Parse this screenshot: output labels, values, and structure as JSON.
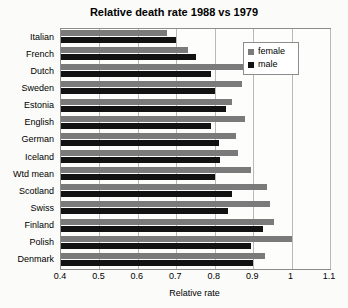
{
  "chart_data": {
    "type": "bar",
    "orientation": "horizontal",
    "title": "Relative death rate 1988 vs 1979",
    "xlabel": "Relative rate",
    "ylabel": "",
    "xlim": [
      0.4,
      1.1
    ],
    "xticks": [
      "0.4",
      "0.5",
      "0.6",
      "0.7",
      "0.8",
      "0.9",
      "1",
      "1.1"
    ],
    "xtick_values": [
      0.4,
      0.5,
      0.6,
      0.7,
      0.8,
      0.9,
      1.0,
      1.1
    ],
    "grid": "vertical",
    "legend_position": "top-right",
    "categories": [
      "Italian",
      "French",
      "Dutch",
      "Sweden",
      "Estonia",
      "English",
      "German",
      "Iceland",
      "Wtd mean",
      "Scotland",
      "Swiss",
      "Finland",
      "Polish",
      "Denmark"
    ],
    "series": [
      {
        "name": "female",
        "color": "#7a7a7a",
        "values": [
          0.675,
          0.73,
          0.93,
          0.87,
          0.845,
          0.88,
          0.855,
          0.86,
          0.895,
          0.935,
          0.945,
          0.955,
          1.0,
          0.93
        ]
      },
      {
        "name": "male",
        "color": "#121212",
        "values": [
          0.7,
          0.75,
          0.79,
          0.8,
          0.83,
          0.79,
          0.81,
          0.815,
          0.8,
          0.845,
          0.835,
          0.925,
          0.895,
          0.9
        ]
      }
    ]
  },
  "legend": {
    "items": [
      {
        "label": "female",
        "color": "#7a7a7a"
      },
      {
        "label": "male",
        "color": "#121212"
      }
    ]
  }
}
